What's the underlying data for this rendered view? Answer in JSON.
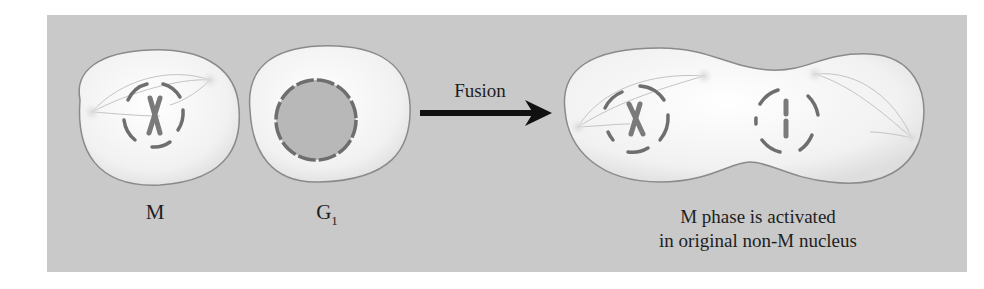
{
  "figure": {
    "cells": [
      {
        "id": "m-cell",
        "label": "M",
        "state": "mitotic, nuclear envelope breaking down, condensed chromosome, spindle poles"
      },
      {
        "id": "g1-cell",
        "label": "G",
        "label_subscript": "1",
        "state": "interphase, intact nucleus"
      }
    ],
    "process": {
      "label": "Fusion",
      "arrow": "right-arrow"
    },
    "result": {
      "state": "fused binucleate cell, both nuclei in M phase",
      "caption_line1": "M phase is activated",
      "caption_line2": "in original non-M nucleus"
    },
    "colors": {
      "background": "#c9c9c9",
      "cell_fill": "#f2f2f2",
      "cell_outline": "#8a8a8a",
      "nucleus_envelope": "#6e6e6e",
      "chromosome": "#7a7a7a",
      "arrow": "#111111",
      "text": "#1e1e1e"
    }
  }
}
